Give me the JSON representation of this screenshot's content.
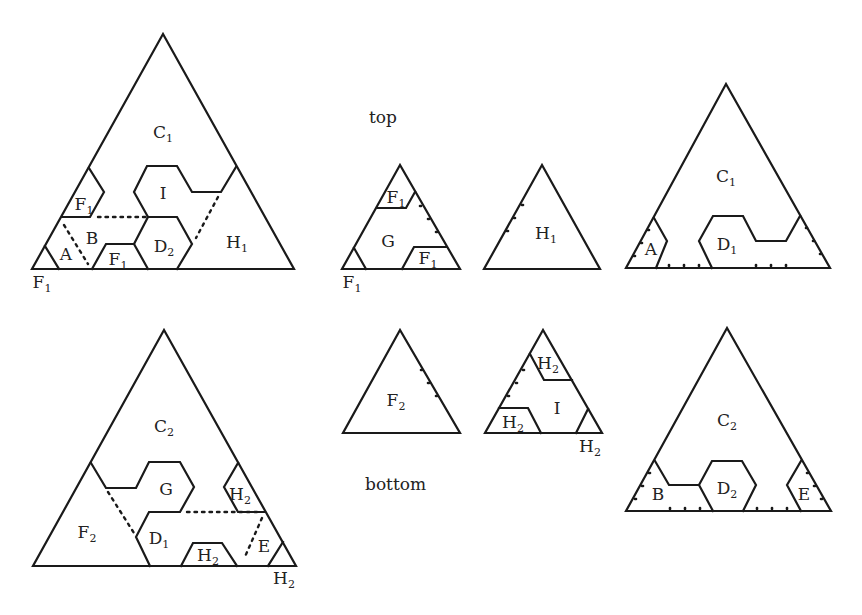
{
  "captions": {
    "top": "top",
    "bottom": "bottom"
  },
  "labels": {
    "t1": {
      "C": "C",
      "C_sub": "1",
      "I": "I",
      "F_a": "F",
      "F_a_sub": "1",
      "B": "B",
      "A": "A",
      "F_b": "F",
      "F_b_sub": "1",
      "D": "D",
      "D_sub": "2",
      "H": "H",
      "H_sub": "1",
      "corner": "F",
      "corner_sub": "1"
    },
    "t2": {
      "F_a": "F",
      "F_a_sub": "1",
      "G": "G",
      "F_b": "F",
      "F_b_sub": "1",
      "corner": "F",
      "corner_sub": "1"
    },
    "t3": {
      "H": "H",
      "H_sub": "1"
    },
    "t4": {
      "C": "C",
      "C_sub": "1",
      "A": "A",
      "D": "D",
      "D_sub": "1"
    },
    "t5": {
      "C": "C",
      "C_sub": "2",
      "G": "G",
      "H_a": "H",
      "H_a_sub": "2",
      "F": "F",
      "F_sub": "2",
      "D": "D",
      "D_sub": "1",
      "H_b": "H",
      "H_b_sub": "2",
      "E": "E",
      "corner": "H",
      "corner_sub": "2"
    },
    "t6": {
      "F": "F",
      "F_sub": "2"
    },
    "t7": {
      "H_a": "H",
      "H_a_sub": "2",
      "I": "I",
      "H_b": "H",
      "H_b_sub": "2",
      "corner": "H",
      "corner_sub": "2"
    },
    "t8": {
      "C": "C",
      "C_sub": "2",
      "B": "B",
      "D": "D",
      "D_sub": "2",
      "E": "E"
    }
  }
}
